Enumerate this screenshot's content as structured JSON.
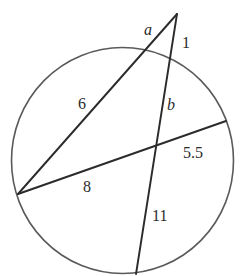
{
  "figure": {
    "type": "intersecting secants and chords in a circle",
    "circle": {
      "cx": 122.5,
      "cy": 160.5,
      "rx": 111,
      "ry": 113
    },
    "points": {
      "P_external": [
        177,
        14
      ],
      "A_secant1_entry": [
        146,
        50
      ],
      "L_left_point": [
        18,
        194
      ],
      "B_secant2_entry": [
        171,
        58
      ],
      "D_bottom_point": [
        136,
        274
      ],
      "R_chord_end": [
        226,
        121
      ],
      "X_intersection": [
        155,
        145
      ]
    },
    "labels": {
      "a": "a",
      "one": "1",
      "six": "6",
      "b": "b",
      "five_five": "5.5",
      "eight": "8",
      "eleven": "11"
    },
    "segments_meaning": {
      "a": "external part of left secant (P to circle)",
      "one": "external part of right secant (P to circle)",
      "six": "internal part of left secant (circle to left point)",
      "b": "right secant from circle entry to chord intersection",
      "five_five": "chord from intersection to right circle point",
      "eight": "chord from left point to intersection",
      "eleven": "right secant from intersection to bottom circle point"
    },
    "colors": {
      "line": "#2b2b2b",
      "circle": "#5a5a5a",
      "background": "#ffffff"
    }
  }
}
